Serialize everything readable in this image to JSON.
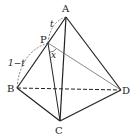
{
  "figure": {
    "type": "tetrahedron",
    "vertices": {
      "A": {
        "label": "A",
        "x": 66,
        "y": 17
      },
      "B": {
        "label": "B",
        "x": 17,
        "y": 88
      },
      "C": {
        "label": "C",
        "x": 60,
        "y": 121
      },
      "D": {
        "label": "D",
        "x": 121,
        "y": 90
      },
      "P": {
        "label": "P",
        "x": 48,
        "y": 43
      }
    },
    "labels": {
      "segment_AP": "t",
      "segment_PB": "1−t",
      "angle_CPD": "x"
    },
    "colors": {
      "line": "#222222",
      "background": "#ffffff"
    }
  }
}
